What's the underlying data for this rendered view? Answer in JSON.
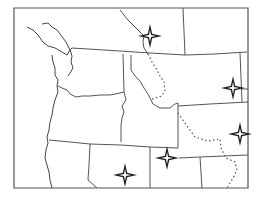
{
  "map": {
    "title": "Northwestern United States outline map",
    "colors": {
      "background": "#ffffff",
      "lines": "#555555",
      "markers": "#222222"
    },
    "regions": [
      "Washington",
      "Oregon",
      "Idaho",
      "Montana",
      "Wyoming",
      "Nevada",
      "Utah",
      "Colorado",
      "North Dakota",
      "South Dakota"
    ],
    "route": {
      "style": "dotted",
      "description": "Dotted route line"
    },
    "markers": [
      {
        "id": "m1",
        "icon": "four-point-star-icon",
        "x": 150,
        "y": 36
      },
      {
        "id": "m2",
        "icon": "four-point-star-icon",
        "x": 233,
        "y": 88
      },
      {
        "id": "m3",
        "icon": "four-point-star-icon",
        "x": 240,
        "y": 134
      },
      {
        "id": "m4",
        "icon": "four-point-star-icon",
        "x": 167,
        "y": 158
      },
      {
        "id": "m5",
        "icon": "four-point-star-icon",
        "x": 125,
        "y": 175
      }
    ]
  }
}
